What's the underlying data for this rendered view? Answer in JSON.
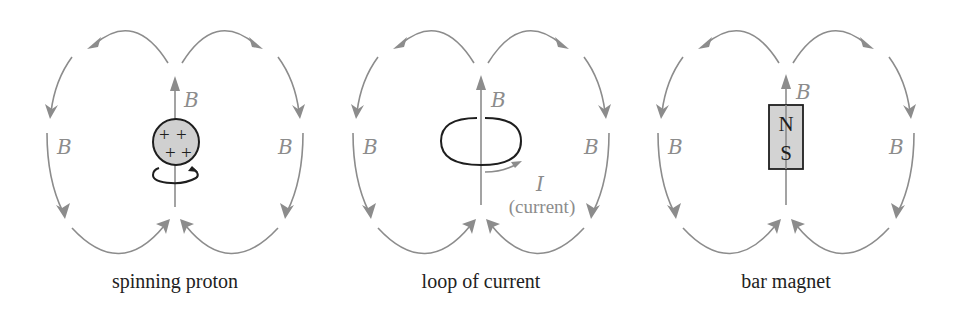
{
  "figure": {
    "colors": {
      "field_line": "#8c8c8c",
      "outline": "#1e1e1e",
      "fill": "#d0d0d0",
      "caption": "#222222"
    },
    "field_label": "B",
    "panels": [
      {
        "id": "proton",
        "caption": "spinning proton",
        "charges": [
          "+",
          "+",
          "+",
          "+"
        ]
      },
      {
        "id": "loop",
        "caption": "loop of current",
        "current_symbol": "I",
        "current_label": "(current)"
      },
      {
        "id": "magnet",
        "caption": "bar magnet",
        "north": "N",
        "south": "S"
      }
    ]
  }
}
